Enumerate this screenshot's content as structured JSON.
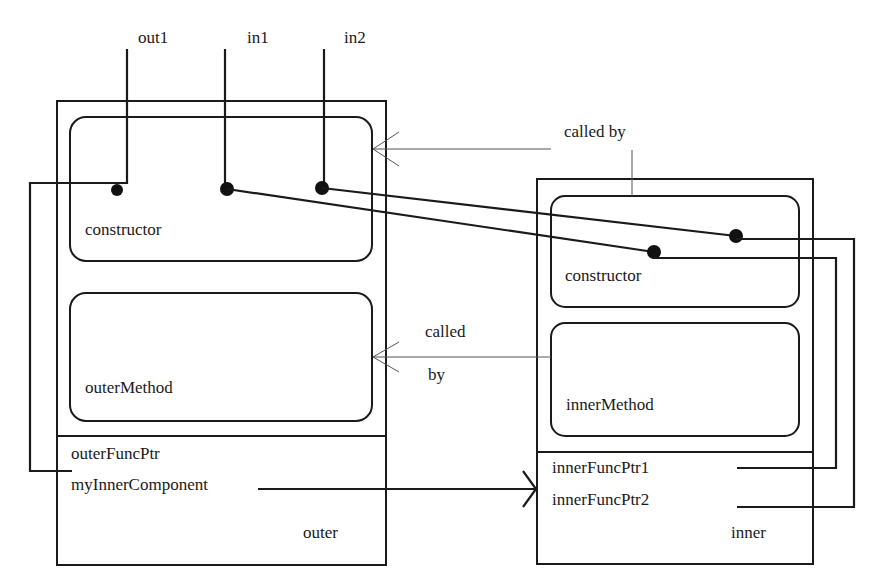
{
  "diagram": {
    "type": "component-wiring",
    "ports": {
      "out1": "out1",
      "in1": "in1",
      "in2": "in2"
    },
    "outer": {
      "name": "outer",
      "constructor_label": "constructor",
      "method_label": "outerMethod",
      "fields": [
        "outerFuncPtr",
        "myInnerComponent"
      ]
    },
    "inner": {
      "name": "inner",
      "constructor_label": "constructor",
      "method_label": "innerMethod",
      "fields": [
        "innerFuncPtr1",
        "innerFuncPtr2"
      ]
    },
    "annotations": {
      "called_by_top": "called by",
      "called_by_mid_line1": "called",
      "called_by_mid_line2": "by"
    },
    "colors": {
      "stroke": "#1a1a1a",
      "thin_arrow": "#555555",
      "background": "#ffffff"
    }
  }
}
